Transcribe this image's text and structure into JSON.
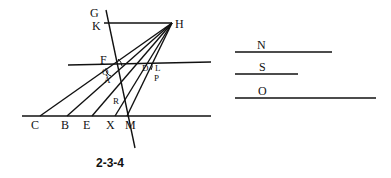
{
  "figure": {
    "caption": "2-3-4",
    "points": {
      "G": {
        "label": "G",
        "x": 95,
        "y": 14
      },
      "K": {
        "label": "K",
        "x": 97,
        "y": 27
      },
      "H": {
        "label": "H",
        "x": 180,
        "y": 27
      },
      "F": {
        "label": "F",
        "x": 101,
        "y": 60
      },
      "Q": {
        "label": "Q",
        "x": 108,
        "y": 74
      },
      "A": {
        "label": "A",
        "x": 110,
        "y": 83
      },
      "D": {
        "label": "D",
        "x": 147,
        "y": 71
      },
      "L": {
        "label": "L",
        "x": 157,
        "y": 71
      },
      "P": {
        "label": "P",
        "x": 156,
        "y": 82
      },
      "R": {
        "label": "R",
        "x": 116,
        "y": 102
      },
      "C": {
        "label": "C",
        "x": 34,
        "y": 128
      },
      "B": {
        "label": "B",
        "x": 63,
        "y": 128
      },
      "E": {
        "label": "E",
        "x": 86,
        "y": 128
      },
      "X": {
        "label": "X",
        "x": 110,
        "y": 128
      },
      "M": {
        "label": "M",
        "x": 128,
        "y": 128
      }
    },
    "segments": [
      {
        "name": "KH",
        "x1": 104,
        "y1": 23,
        "x2": 172,
        "y2": 23
      },
      {
        "name": "transversal-GM",
        "x1": 106,
        "y1": 10,
        "x2": 135,
        "y2": 148
      },
      {
        "name": "upper-line",
        "x1": 68,
        "y1": 65,
        "x2": 211,
        "y2": 62
      },
      {
        "name": "base-line",
        "x1": 22,
        "y1": 116,
        "x2": 211,
        "y2": 116
      },
      {
        "name": "HC",
        "x1": 172,
        "y1": 23,
        "x2": 40,
        "y2": 116
      },
      {
        "name": "HB",
        "x1": 172,
        "y1": 23,
        "x2": 67,
        "y2": 116
      },
      {
        "name": "HE",
        "x1": 172,
        "y1": 23,
        "x2": 92,
        "y2": 116
      },
      {
        "name": "HX",
        "x1": 172,
        "y1": 23,
        "x2": 115,
        "y2": 116
      },
      {
        "name": "HM",
        "x1": 172,
        "y1": 23,
        "x2": 127,
        "y2": 116
      }
    ],
    "reference_segments": [
      {
        "label": "N",
        "x1": 235,
        "y1": 52,
        "x2": 332,
        "y2": 52,
        "label_x": 260,
        "label_y": 49
      },
      {
        "label": "S",
        "x1": 235,
        "y1": 74,
        "x2": 298,
        "y2": 74,
        "label_x": 260,
        "label_y": 71
      },
      {
        "label": "O",
        "x1": 235,
        "y1": 98,
        "x2": 376,
        "y2": 98,
        "label_x": 258,
        "label_y": 95
      }
    ]
  }
}
